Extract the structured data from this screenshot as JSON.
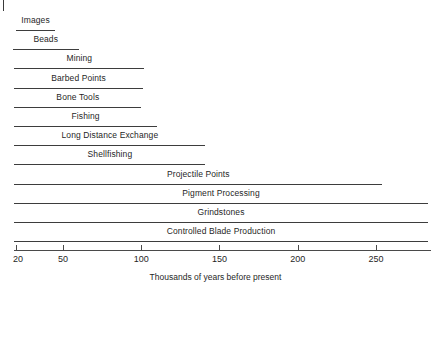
{
  "chart_data": {
    "type": "bar",
    "orientation": "horizontal",
    "title": "",
    "subtitle": "",
    "xlabel": "Thousands of years before present",
    "ylabel": "",
    "xlim": [
      20,
      285
    ],
    "xticks": [
      20,
      50,
      100,
      150,
      200,
      250
    ],
    "xtick_labels": [
      "20",
      "50",
      "100",
      "150",
      "200",
      "250"
    ],
    "grid": false,
    "legend": null,
    "note": "Each horizontal line is a range bar showing the time span (in thousands of years before present) over which each behaviour/technology is documented. Bars are drawn with the label centered above the line.",
    "categories": [
      "Images",
      "Beads",
      "Mining",
      "Barbed Points",
      "Bone Tools",
      "Fishing",
      "Long Distance Exchange",
      "Shellfishing",
      "Projectile Points",
      "Pigment Processing",
      "Grindstones",
      "Controlled Blade Production"
    ],
    "bars": [
      {
        "label": "Images",
        "start": 20,
        "end": 45
      },
      {
        "label": "Beads",
        "start": 18,
        "end": 60
      },
      {
        "label": "Mining",
        "start": 19,
        "end": 102
      },
      {
        "label": "Barbed Points",
        "start": 19,
        "end": 101
      },
      {
        "label": "Bone Tools",
        "start": 19,
        "end": 100
      },
      {
        "label": "Fishing",
        "start": 19,
        "end": 110
      },
      {
        "label": "Long Distance Exchange",
        "start": 19,
        "end": 141
      },
      {
        "label": "Shellfishing",
        "start": 19,
        "end": 141
      },
      {
        "label": "Projectile Points",
        "start": 19,
        "end": 254
      },
      {
        "label": "Pigment Processing",
        "start": 19,
        "end": 283
      },
      {
        "label": "Grindstones",
        "start": 19,
        "end": 283
      },
      {
        "label": "Controlled Blade Production",
        "start": 19,
        "end": 283
      }
    ],
    "colors": {
      "line": "#3d3d3d",
      "axis": "#4a4a4a",
      "text": "#1f1f1f",
      "background": "#ffffff"
    }
  }
}
